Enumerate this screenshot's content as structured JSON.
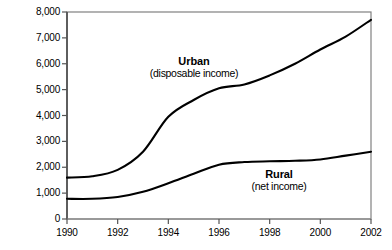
{
  "chart_data": {
    "type": "line",
    "title": "",
    "xlabel": "",
    "ylabel": "Average income per head, yuan",
    "xlim": [
      1990,
      2002
    ],
    "ylim": [
      0,
      8000
    ],
    "grid": false,
    "legend_position": "inline-annotation",
    "x_ticks": [
      "1990",
      "1992",
      "1994",
      "1996",
      "1998",
      "2000",
      "2002"
    ],
    "x_tick_values": [
      1990,
      1992,
      1994,
      1996,
      1998,
      2000,
      2002
    ],
    "y_ticks": [
      "0",
      "1,000",
      "2,000",
      "3,000",
      "4,000",
      "5,000",
      "6,000",
      "7,000",
      "8,000"
    ],
    "y_tick_values": [
      0,
      1000,
      2000,
      3000,
      4000,
      5000,
      6000,
      7000,
      8000
    ],
    "x": [
      1990,
      1991,
      1992,
      1993,
      1994,
      1995,
      1996,
      1997,
      1998,
      1999,
      2000,
      2001,
      2002
    ],
    "series": [
      {
        "name": "Urban",
        "sublabel": "(disposable income)",
        "color": "#000000",
        "values": [
          1600,
          1650,
          1900,
          2600,
          3950,
          4600,
          5050,
          5200,
          5550,
          6000,
          6550,
          7050,
          7700
        ]
      },
      {
        "name": "Rural",
        "sublabel": "(net income)",
        "color": "#000000",
        "values": [
          780,
          780,
          850,
          1050,
          1380,
          1750,
          2100,
          2200,
          2230,
          2250,
          2300,
          2450,
          2600
        ]
      }
    ]
  },
  "axis": {
    "y_title": "Average income per head, yuan"
  },
  "annotations": {
    "urban": {
      "name": "Urban",
      "sublabel": "(disposable income)"
    },
    "rural": {
      "name": "Rural",
      "sublabel": "(net income)"
    }
  },
  "colors": {
    "line": "#000000",
    "frame": "#808080",
    "spine": "#555555",
    "background": "#ffffff"
  }
}
